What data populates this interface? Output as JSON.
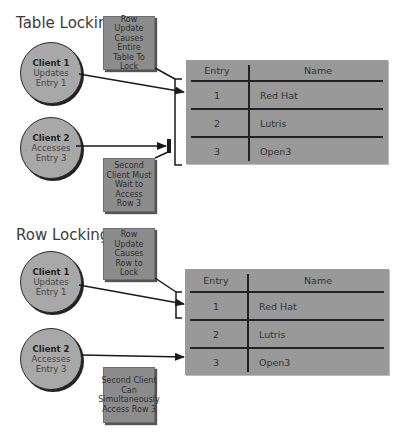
{
  "sections": [
    {
      "title": "Table Locking",
      "client1": {
        "name": "Client 1",
        "line1": "Updates",
        "line2": "Entry 1"
      },
      "client2": {
        "name": "Client 2",
        "line1": "Accesses",
        "line2": "Entry 3"
      },
      "note_top": "Row Update Causes Entire Table To Lock",
      "note_bottom": "Second Client Must Wait to Access Row 3",
      "table": {
        "headers": [
          "Entry",
          "Name"
        ],
        "rows": [
          [
            "1",
            "Red Hat"
          ],
          [
            "2",
            "Lutris"
          ],
          [
            "3",
            "Open3"
          ]
        ]
      }
    },
    {
      "title": "Row Locking",
      "client1": {
        "name": "Client 1",
        "line1": "Updates",
        "line2": "Entry 1"
      },
      "client2": {
        "name": "Client 2",
        "line1": "Accesses",
        "line2": "Entry 3"
      },
      "note_top": "Row Update Causes Row to Lock",
      "note_bottom": "Second Client Can Simultaneously Access Row 3",
      "table": {
        "headers": [
          "Entry",
          "Name"
        ],
        "rows": [
          [
            "1",
            "Red Hat"
          ],
          [
            "2",
            "Lutris"
          ],
          [
            "3",
            "Open3"
          ]
        ]
      }
    }
  ],
  "colors": {
    "client_fill": "#a8a8a8",
    "note_fill": "#8c8c8c",
    "table_fill": "#999999",
    "line": "#222222"
  }
}
